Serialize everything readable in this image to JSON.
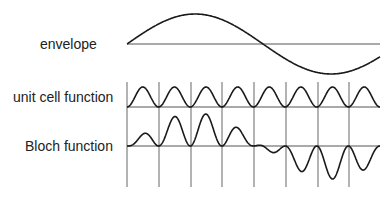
{
  "diagram": {
    "labels": {
      "envelope": "envelope",
      "unit_cell": "unit cell function",
      "bloch": "Bloch function"
    },
    "cell_count": 8,
    "colors": {
      "stroke": "#1a1a1a",
      "line": "#555555"
    }
  }
}
